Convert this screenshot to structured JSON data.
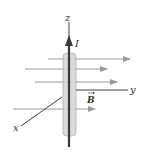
{
  "diagram": {
    "labels": {
      "z_axis": "z",
      "y_axis": "y",
      "x_axis": "x",
      "current": "I",
      "field": "B"
    },
    "colors": {
      "axis": "#2a2a2a",
      "wire": "#3a3a3a",
      "cylinder_fill": "#d4d4d4",
      "cylinder_stroke": "#b0b0b0",
      "field_lines": "#9a9a9a"
    }
  }
}
